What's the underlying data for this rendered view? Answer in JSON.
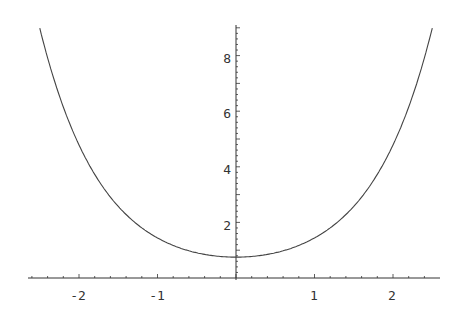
{
  "chart_data": {
    "type": "line",
    "title": "",
    "xlabel": "",
    "ylabel": "",
    "xlim": [
      -2.6,
      2.6
    ],
    "ylim": [
      0,
      9.1
    ],
    "grid": false,
    "legend": null,
    "x_ticks": [
      "-2",
      "-1",
      "1",
      "2"
    ],
    "y_ticks": [
      "2",
      "4",
      "6",
      "8"
    ],
    "series": [
      {
        "name": "f(x)",
        "x": [
          -2.5,
          -2.0,
          -1.5,
          -1.0,
          -0.5,
          0.0,
          0.5,
          1.0,
          1.5,
          2.0,
          2.5
        ],
        "values": [
          9.0,
          4.8,
          2.55,
          1.45,
          0.91,
          0.75,
          0.91,
          1.45,
          2.55,
          4.8,
          9.0
        ]
      }
    ]
  },
  "axes": {
    "x_tick_labels": [
      "-2",
      "-1",
      "1",
      "2"
    ],
    "y_tick_labels": [
      "2",
      "4",
      "6",
      "8"
    ],
    "line_color": "#333333"
  }
}
